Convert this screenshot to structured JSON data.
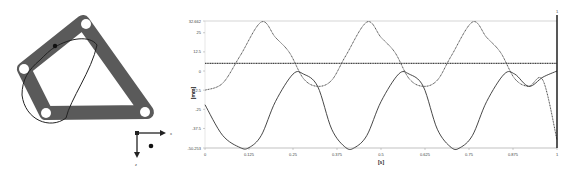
{
  "diagram": {
    "axes": {
      "x_label": "x",
      "z_label": "z"
    },
    "frame": {
      "type": "triangular-linkage",
      "holes": 4,
      "color": "#555555"
    }
  },
  "chart_data": {
    "type": "line",
    "title": "",
    "xlabel": "[s]",
    "ylabel": "[mm]",
    "xlim": [
      0,
      1
    ],
    "ylim": [
      -50.253,
      32.662
    ],
    "x_ticks": [
      "0",
      "0.125",
      "0.25",
      "0.375",
      "0.5",
      "0.625",
      "0.75",
      "0.875",
      "1"
    ],
    "y_ticks": [
      "32.662",
      "25",
      "12.5",
      "0",
      "-12.5",
      "-25",
      "-37.5",
      "-50.253"
    ],
    "cursor": {
      "x": 1,
      "label": "1"
    },
    "grid": false,
    "series": [
      {
        "name": "displacement-1",
        "style": "dotted",
        "x": [
          0,
          0.05,
          0.1,
          0.16,
          0.2,
          0.24,
          0.28,
          0.32,
          0.36,
          0.4,
          0.46,
          0.5,
          0.54,
          0.58,
          0.62,
          0.66,
          0.7,
          0.76,
          0.8,
          0.84,
          0.88,
          0.92,
          0.96,
          1.0
        ],
        "values": [
          -12.5,
          -8,
          10,
          32,
          22,
          12,
          -5,
          -10,
          -6,
          10,
          32,
          22,
          12,
          -5,
          -10,
          -6,
          10,
          32,
          22,
          12,
          -5,
          -10,
          -6,
          -45
        ]
      },
      {
        "name": "displacement-2",
        "style": "solid",
        "x": [
          0,
          0.05,
          0.1,
          0.125,
          0.16,
          0.2,
          0.25,
          0.28,
          0.32,
          0.36,
          0.4,
          0.425,
          0.46,
          0.5,
          0.55,
          0.58,
          0.62,
          0.66,
          0.7,
          0.725,
          0.76,
          0.8,
          0.85,
          0.88,
          0.92,
          0.96,
          1.0
        ],
        "values": [
          -22,
          -42,
          -50,
          -50,
          -42,
          -20,
          -2,
          -2,
          -10,
          -38,
          -50,
          -50,
          -42,
          -20,
          -2,
          -2,
          -10,
          -38,
          -50,
          -50,
          -42,
          -20,
          -2,
          -2,
          -10,
          -4,
          0
        ]
      },
      {
        "name": "reference",
        "style": "dotted-thick",
        "x": [
          0,
          1
        ],
        "values": [
          5,
          5
        ]
      }
    ]
  }
}
